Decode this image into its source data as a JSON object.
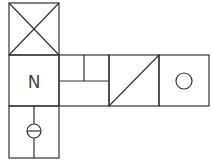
{
  "diagram": {
    "type": "symbol-layout",
    "stroke_color": "#333333",
    "background": "#ffffff",
    "cells": [
      {
        "id": "top",
        "symbol": "cross-box"
      },
      {
        "id": "middle-left",
        "symbol": "label-box",
        "label": "N"
      },
      {
        "id": "split-box",
        "symbol": "split-upper-vertical"
      },
      {
        "id": "diagonal",
        "symbol": "diagonal-box"
      },
      {
        "id": "circle",
        "symbol": "circle-box"
      },
      {
        "id": "bottom",
        "symbol": "circle-with-bar-on-line"
      }
    ],
    "labels": {
      "n_label": "N"
    }
  }
}
